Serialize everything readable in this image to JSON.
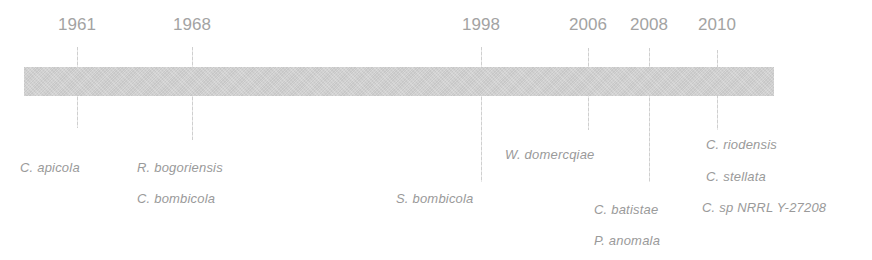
{
  "timeline": {
    "bar_color": "#d2d2d2",
    "text_color": "#9a9a9a",
    "events": [
      {
        "year": "1961",
        "species": [
          "C. apicola"
        ]
      },
      {
        "year": "1968",
        "species": [
          "R. bogoriensis",
          "C. bombicola"
        ]
      },
      {
        "year": "1998",
        "species": [
          "S. bombicola"
        ]
      },
      {
        "year": "2006",
        "species": [
          "W. domercqiae"
        ]
      },
      {
        "year": "2008",
        "species": [
          "C. batistae",
          "P. anomala"
        ]
      },
      {
        "year": "2010",
        "species": [
          "C. riodensis",
          "C. stellata",
          "C. sp NRRL Y-27208"
        ]
      }
    ]
  }
}
